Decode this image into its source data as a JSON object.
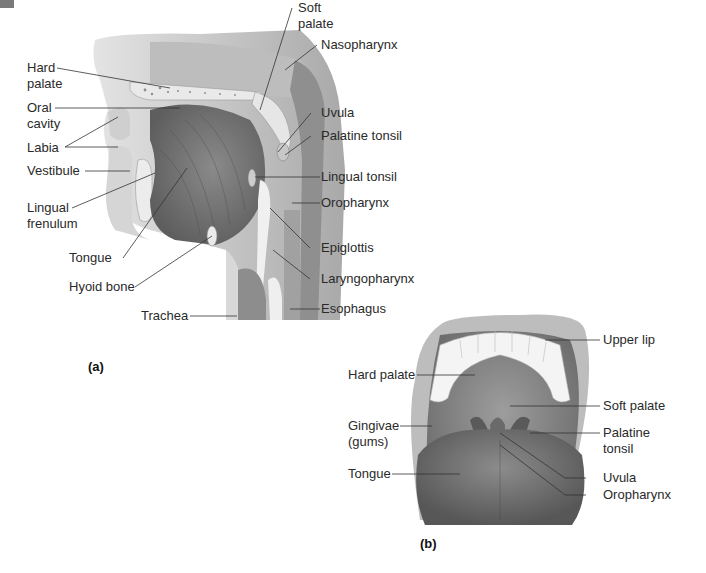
{
  "corner_marker": "grey-tab",
  "panel_a": {
    "tag": "(a)",
    "labels": {
      "hard_palate": "Hard\npalate",
      "oral_cavity": "Oral\ncavity",
      "labia": "Labia",
      "vestibule": "Vestibule",
      "lingual_frenulum": "Lingual\nfrenulum",
      "tongue": "Tongue",
      "hyoid_bone": "Hyoid bone",
      "trachea": "Trachea",
      "soft_palate": "Soft\npalate",
      "nasopharynx": "Nasopharynx",
      "uvula": "Uvula",
      "palatine_tonsil": "Palatine tonsil",
      "lingual_tonsil": "Lingual tonsil",
      "oropharynx": "Oropharynx",
      "epiglottis": "Epiglottis",
      "laryngopharynx": "Laryngopharynx",
      "esophagus": "Esophagus"
    }
  },
  "panel_b": {
    "tag": "(b)",
    "labels": {
      "upper_lip": "Upper lip",
      "hard_palate": "Hard palate",
      "soft_palate": "Soft palate",
      "gingivae": "Gingivae\n(gums)",
      "palatine_tonsil": "Palatine\ntonsil",
      "tongue": "Tongue",
      "uvula": "Uvula",
      "oropharynx": "Oropharynx"
    }
  },
  "colors": {
    "tissue_dark": "#7d7d7d",
    "tissue_mid": "#a8a8a8",
    "tissue_light": "#d4d4d4",
    "bone": "#e6e6e6",
    "leader_line": "#333333"
  }
}
